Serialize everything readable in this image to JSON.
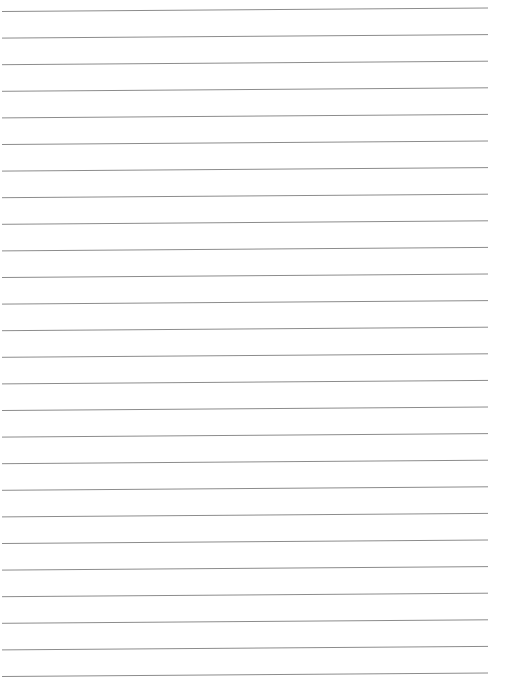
{
  "page": {
    "type": "lined-paper",
    "background": "#ffffff",
    "line_color": "#8c8c8c",
    "line_width": 1,
    "line_count": 26,
    "first_line_y_left": 11.5,
    "first_line_y_right": 8,
    "line_spacing": 26.6,
    "line_x_start": 2,
    "line_x_end": 488
  }
}
